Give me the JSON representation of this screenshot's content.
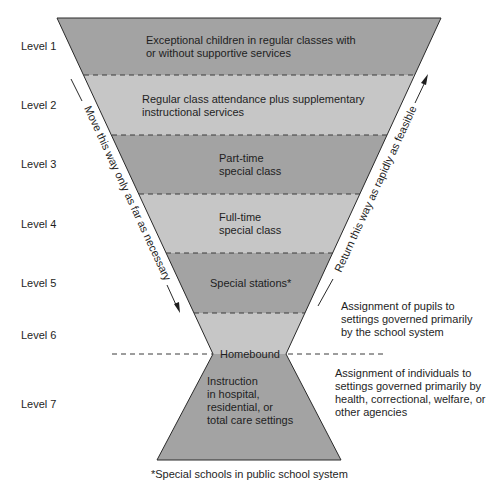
{
  "levels": [
    {
      "label": "Level 1",
      "lines": [
        "Exceptional children in regular classes with",
        "or without supportive services"
      ]
    },
    {
      "label": "Level 2",
      "lines": [
        "Regular class attendance plus supplementary",
        "instructional services"
      ]
    },
    {
      "label": "Level 3",
      "lines": [
        "Part-time",
        "special class"
      ]
    },
    {
      "label": "Level 4",
      "lines": [
        "Full-time",
        "special class"
      ]
    },
    {
      "label": "Level 5",
      "lines": [
        "Special stations*"
      ]
    },
    {
      "label": "Level 6",
      "lines": [
        "Homebound"
      ]
    },
    {
      "label": "Level 7",
      "lines": [
        "Instruction",
        "in hospital,",
        "residential, or",
        "total care settings"
      ]
    }
  ],
  "arrows": {
    "down": "Move this way only as far as necessary",
    "up": "Return this way as rapidly as feasible"
  },
  "notes": {
    "school_system": [
      "Assignment of pupils to",
      "settings governed primarily",
      "by the school system"
    ],
    "other_agencies": [
      "Assignment of individuals to",
      "settings governed primarily by",
      "health, correctional, welfare, or",
      "other agencies"
    ]
  },
  "footnote": "*Special schools in public school system",
  "colors": {
    "dark_band": "#a3a3a3",
    "light_band": "#c6c6c6",
    "outline": "#2a2a2a",
    "text": "#1e1e1e"
  }
}
